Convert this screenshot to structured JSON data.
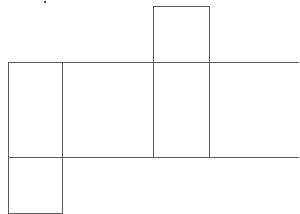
{
  "diagram": {
    "type": "net-of-prism",
    "stroke_color": "#5a5a5a",
    "background": "#ffffff",
    "faces": [
      {
        "id": "top-flap",
        "x": 153,
        "y": 6,
        "w": 56,
        "h": 56
      },
      {
        "id": "left-face",
        "x": 8,
        "y": 62,
        "w": 54,
        "h": 95
      },
      {
        "id": "front-face",
        "x": 62,
        "y": 62,
        "w": 91,
        "h": 95
      },
      {
        "id": "side-face",
        "x": 153,
        "y": 62,
        "w": 56,
        "h": 95
      },
      {
        "id": "back-face-open",
        "x": 209,
        "y": 62,
        "w": 90,
        "h": 95
      },
      {
        "id": "bottom-flap",
        "x": 8,
        "y": 157,
        "w": 54,
        "h": 56
      }
    ],
    "marks": [
      {
        "id": "dot",
        "x": 45,
        "y": 2
      }
    ]
  }
}
